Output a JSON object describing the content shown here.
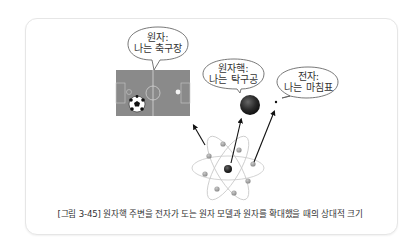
{
  "figure": {
    "caption": "[그림 3-45] 원자핵 주변을 전자가 도는 원자 모델과 원자를 확대했을 때의 상대적 크기",
    "bubbles": {
      "atom": {
        "line1": "원자:",
        "line2": "나는 축구장"
      },
      "nucleus": {
        "line1": "원자핵:",
        "line2": "나는 탁구공"
      },
      "electron": {
        "line1": "전자:",
        "line2": "나는 마침표"
      }
    },
    "colors": {
      "field": "#8a8a8a",
      "field_lines": "#d8d8d8",
      "nucleus": "#2a2a2a",
      "electron": "#9a9a9a",
      "orbit": "#c8c8c8",
      "arrow": "#111111",
      "frame_border": "#e6e6e6"
    }
  }
}
